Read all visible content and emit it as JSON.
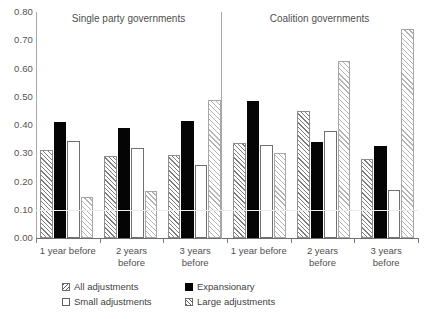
{
  "chart_data": {
    "type": "bar",
    "title": "",
    "xlabel": "",
    "ylabel": "",
    "ylim": [
      0.0,
      0.8
    ],
    "ytick_labels": [
      "0.80",
      "0.70",
      "0.60",
      "0.50",
      "0.40",
      "0.30",
      "0.20",
      "0.10",
      "0.00"
    ],
    "ytick_values": [
      0.8,
      0.7,
      0.6,
      0.5,
      0.4,
      0.3,
      0.2,
      0.1,
      0.0
    ],
    "grid": false,
    "legend_position": "bottom",
    "panels": [
      {
        "name": "single-party",
        "title": "Single party governments",
        "categories": [
          "1 year before",
          "2 years\nbefore",
          "3 years\nbefore"
        ]
      },
      {
        "name": "coalition",
        "title": "Coalition governments",
        "categories": [
          "1 year before",
          "2 years\nbefore",
          "3 years\nbefore"
        ]
      }
    ],
    "categories": [
      "1 year before",
      "2 years before",
      "3 years before",
      "1 year before",
      "2 years before",
      "3 years before"
    ],
    "series": [
      {
        "name": "All adjustments",
        "style": "hatch-dark",
        "values": [
          0.31,
          0.29,
          0.295,
          0.335,
          0.45,
          0.28
        ]
      },
      {
        "name": "Expansionary",
        "style": "solid-black",
        "values": [
          0.41,
          0.39,
          0.415,
          0.485,
          0.34,
          0.325
        ]
      },
      {
        "name": "Small adjustments",
        "style": "open-white",
        "values": [
          0.345,
          0.32,
          0.26,
          0.33,
          0.38,
          0.17
        ]
      },
      {
        "name": "Large adjustments",
        "style": "hatch-light",
        "values": [
          0.145,
          0.165,
          0.49,
          0.3,
          0.625,
          0.74
        ]
      }
    ]
  },
  "legend": {
    "items": [
      {
        "label": "All adjustments",
        "swatch": "hatch-dark-swatch"
      },
      {
        "label": "Expansionary",
        "swatch": "solid-black-swatch"
      },
      {
        "label": "Small adjustments",
        "swatch": "open-white-swatch"
      },
      {
        "label": "Large adjustments",
        "swatch": "hatch-light-swatch"
      }
    ]
  }
}
